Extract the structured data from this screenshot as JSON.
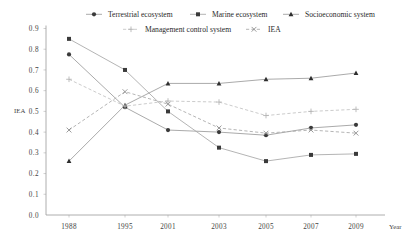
{
  "chart_data": {
    "type": "line",
    "title": "",
    "xlabel": "Year",
    "ylabel": "IEA",
    "categories": [
      "1988",
      "1995",
      "2001",
      "2003",
      "2005",
      "2007",
      "2009"
    ],
    "ylim": [
      0.0,
      0.9
    ],
    "ytick_labels": [
      "0.0",
      "0.1",
      "0.2",
      "0.3",
      "0.4",
      "0.5",
      "0.6",
      "0.7",
      "0.8",
      "0.9"
    ],
    "grid": true,
    "legend_position": "top",
    "series": [
      {
        "name": "Terrestrial ecosystem",
        "marker": "circle",
        "color": "#3a3a3a",
        "line_color": "#9b9b9b",
        "dashed": false,
        "values": [
          0.775,
          0.52,
          0.41,
          0.4,
          0.385,
          0.42,
          0.435
        ]
      },
      {
        "name": "Marine ecosystem",
        "marker": "square",
        "color": "#3a3a3a",
        "line_color": "#a6a6a6",
        "dashed": false,
        "values": [
          0.85,
          0.7,
          0.5,
          0.325,
          0.26,
          0.29,
          0.295
        ]
      },
      {
        "name": "Socioeconomic system",
        "marker": "triangle",
        "color": "#2e2e2e",
        "line_color": "#9b9b9b",
        "dashed": false,
        "values": [
          0.26,
          0.53,
          0.635,
          0.635,
          0.655,
          0.66,
          0.685
        ]
      },
      {
        "name": "Management control system",
        "marker": "plus",
        "color": "#b5b5b5",
        "line_color": "#c2c2c2",
        "dashed": true,
        "values": [
          0.655,
          0.525,
          0.55,
          0.545,
          0.48,
          0.5,
          0.51
        ]
      },
      {
        "name": "IEA",
        "marker": "cross",
        "color": "#8e8e8e",
        "line_color": "#a8a8a8",
        "dashed": true,
        "values": [
          0.41,
          0.595,
          0.535,
          0.42,
          0.395,
          0.41,
          0.395
        ]
      }
    ]
  },
  "legend": {
    "row1": [
      "Terrestrial ecosystem",
      "Marine ecosystem",
      "Socioeconomic system"
    ],
    "row2": [
      "Management control system",
      "IEA"
    ]
  },
  "colors": {
    "axis": "#9a9a9a",
    "grid": "#bdbdbd",
    "text": "#333333"
  }
}
